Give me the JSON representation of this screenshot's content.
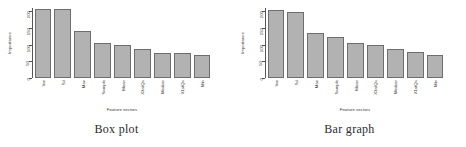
{
  "figure": {
    "panels": [
      {
        "caption": "Box plot",
        "ylabel": "Importance",
        "xlabel": "Feature vectors"
      },
      {
        "caption": "Bar graph",
        "ylabel": "Importance",
        "xlabel": "Feature vectors"
      }
    ],
    "colors": {
      "bar_fill": "#b2b2b2",
      "bar_border": "#6e6e6e",
      "axis": "#555555",
      "text": "#3a3a3a"
    }
  },
  "chart_data": [
    {
      "type": "bar",
      "title": "Box plot",
      "xlabel": "Feature vectors",
      "ylabel": "Importance",
      "categories": [
        "Var",
        "Sd",
        "Max",
        "Sample",
        "Mean",
        "X3rdQu",
        "Median",
        "X1stQu",
        "Min"
      ],
      "values": [
        205,
        205,
        140,
        105,
        100,
        88,
        75,
        74,
        68
      ],
      "ylim": [
        0,
        200
      ],
      "yticks": [
        0,
        50,
        100,
        150,
        200
      ],
      "ytick_labels": [
        "0",
        "50",
        "100",
        "150",
        "200"
      ],
      "grid": false,
      "legend": false
    },
    {
      "type": "bar",
      "title": "Bar graph",
      "xlabel": "Feature vectors",
      "ylabel": "Importance",
      "categories": [
        "Var",
        "Sd",
        "Max",
        "Sample",
        "Mean",
        "X3rdQu",
        "Median",
        "X1stQu",
        "Min"
      ],
      "values": [
        203,
        196,
        133,
        122,
        104,
        98,
        86,
        79,
        70
      ],
      "ylim": [
        0,
        200
      ],
      "yticks": [
        0,
        50,
        100,
        150,
        200
      ],
      "ytick_labels": [
        "0",
        "50",
        "100",
        "150",
        "200"
      ],
      "grid": false,
      "legend": false
    }
  ]
}
